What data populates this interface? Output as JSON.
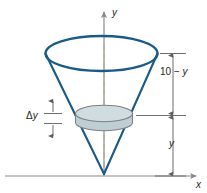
{
  "figure": {
    "axes": {
      "y_label": "y",
      "x_label": "x",
      "axis_color": "#8a8a8a",
      "dashed_axis_color": "#b9ab8e"
    },
    "labels": {
      "height_above_slab": "10 − y",
      "height_above_slab_parts": {
        "number": "10",
        "minus": "−",
        "variable": "y"
      },
      "depth_below_slab": "y",
      "slab_thickness": "Δy",
      "slab_thickness_parts": {
        "delta": "Δ",
        "variable": "y"
      }
    },
    "colors": {
      "cone_stroke": "#1b5a86",
      "slab_fill": "#c7d7dc",
      "slab_stroke": "#7f7f7f",
      "dimension_line": "#6d6d6d",
      "background": "#ffffff"
    }
  }
}
